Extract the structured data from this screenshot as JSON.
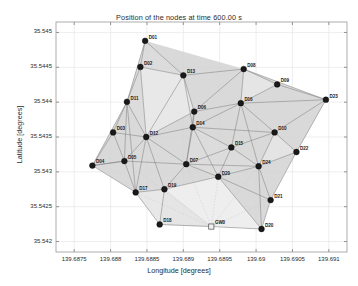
{
  "chart_data": {
    "type": "scatter",
    "title": "Position of the nodes at time 600.00 s",
    "xlabel": "Longitude [degrees]",
    "ylabel": "Latitude [degrees]",
    "xlim": [
      139.68725,
      139.69125
    ],
    "ylim": [
      35.54185,
      35.54515
    ],
    "xticks": [
      "139.6875",
      "139.688",
      "139.6885",
      "139.689",
      "139.6895",
      "139.69",
      "139.6905",
      "139.691"
    ],
    "xtick_values": [
      139.6875,
      139.688,
      139.6885,
      139.689,
      139.6895,
      139.69,
      139.6905,
      139.691
    ],
    "yticks": [
      "35.545",
      "35.5445",
      "35.544",
      "35.5435",
      "35.543",
      "35.5425",
      "35.542"
    ],
    "ytick_values": [
      35.545,
      35.5445,
      35.544,
      35.5435,
      35.543,
      35.5425,
      35.542
    ],
    "grid": true,
    "legend": "none",
    "node_color": "#1a1a1a",
    "edge_color": "#7a7a7a",
    "coverage_color": "#d2d2d2",
    "gateway_marker": "square",
    "node_marker": "circle",
    "nodes": [
      {
        "id": "D01",
        "lon": 139.688475,
        "lat": 35.54488,
        "type": "node"
      },
      {
        "id": "D02",
        "lon": 139.68841,
        "lat": 35.544505,
        "type": "node"
      },
      {
        "id": "D13",
        "lon": 139.689,
        "lat": 35.544385,
        "type": "node"
      },
      {
        "id": "D08",
        "lon": 139.68983,
        "lat": 35.544475,
        "type": "node"
      },
      {
        "id": "D09",
        "lon": 139.69029,
        "lat": 35.544255,
        "type": "node"
      },
      {
        "id": "D23",
        "lon": 139.69096,
        "lat": 35.544035,
        "type": "node"
      },
      {
        "id": "D11",
        "lon": 139.688225,
        "lat": 35.544005,
        "type": "node"
      },
      {
        "id": "D16",
        "lon": 139.68979,
        "lat": 35.543985,
        "type": "node"
      },
      {
        "id": "D06",
        "lon": 139.68915,
        "lat": 35.543865,
        "type": "node"
      },
      {
        "id": "D14",
        "lon": 139.68913,
        "lat": 35.54364,
        "type": "node"
      },
      {
        "id": "D03",
        "lon": 139.688035,
        "lat": 35.543565,
        "type": "node"
      },
      {
        "id": "D12",
        "lon": 139.68849,
        "lat": 35.5435,
        "type": "node"
      },
      {
        "id": "D10",
        "lon": 139.690255,
        "lat": 35.543565,
        "type": "node"
      },
      {
        "id": "D15",
        "lon": 139.68966,
        "lat": 35.54335,
        "type": "node"
      },
      {
        "id": "D22",
        "lon": 139.690555,
        "lat": 35.543285,
        "type": "node"
      },
      {
        "id": "D05",
        "lon": 139.68819,
        "lat": 35.543155,
        "type": "node"
      },
      {
        "id": "D04",
        "lon": 139.68775,
        "lat": 35.54309,
        "type": "node"
      },
      {
        "id": "D07",
        "lon": 139.68904,
        "lat": 35.54311,
        "type": "node"
      },
      {
        "id": "D24",
        "lon": 139.690035,
        "lat": 35.54308,
        "type": "node"
      },
      {
        "id": "D20",
        "lon": 139.68948,
        "lat": 35.54293,
        "type": "node"
      },
      {
        "id": "D17",
        "lon": 139.688345,
        "lat": 35.542705,
        "type": "node"
      },
      {
        "id": "D19",
        "lon": 139.68874,
        "lat": 35.54275,
        "type": "node"
      },
      {
        "id": "D21",
        "lon": 139.6902,
        "lat": 35.542595,
        "type": "node"
      },
      {
        "id": "D18",
        "lon": 139.688675,
        "lat": 35.542245,
        "type": "node"
      },
      {
        "id": "GW0",
        "lon": 139.689385,
        "lat": 35.542215,
        "type": "gateway"
      },
      {
        "id": "D20b",
        "lon": 139.690075,
        "lat": 35.54218,
        "type": "node",
        "label": "D20"
      }
    ],
    "edges": [
      [
        "D01",
        "D02"
      ],
      [
        "D01",
        "D13"
      ],
      [
        "D02",
        "D13"
      ],
      [
        "D02",
        "D11"
      ],
      [
        "D13",
        "D08"
      ],
      [
        "D13",
        "D06"
      ],
      [
        "D13",
        "D14"
      ],
      [
        "D13",
        "D12"
      ],
      [
        "D08",
        "D09"
      ],
      [
        "D08",
        "D16"
      ],
      [
        "D08",
        "D23"
      ],
      [
        "D09",
        "D23"
      ],
      [
        "D09",
        "D16"
      ],
      [
        "D23",
        "D16"
      ],
      [
        "D23",
        "D10"
      ],
      [
        "D23",
        "D22"
      ],
      [
        "D11",
        "D03"
      ],
      [
        "D11",
        "D12"
      ],
      [
        "D11",
        "D05"
      ],
      [
        "D11",
        "D17"
      ],
      [
        "D16",
        "D06"
      ],
      [
        "D16",
        "D14"
      ],
      [
        "D16",
        "D10"
      ],
      [
        "D16",
        "D15"
      ],
      [
        "D16",
        "D24"
      ],
      [
        "D06",
        "D14"
      ],
      [
        "D06",
        "D12"
      ],
      [
        "D06",
        "D07"
      ],
      [
        "D14",
        "D12"
      ],
      [
        "D14",
        "D07"
      ],
      [
        "D14",
        "D15"
      ],
      [
        "D14",
        "D20"
      ],
      [
        "D03",
        "D12"
      ],
      [
        "D03",
        "D05"
      ],
      [
        "D03",
        "D04"
      ],
      [
        "D12",
        "D05"
      ],
      [
        "D12",
        "D07"
      ],
      [
        "D12",
        "D17"
      ],
      [
        "D10",
        "D22"
      ],
      [
        "D10",
        "D15"
      ],
      [
        "D10",
        "D24"
      ],
      [
        "D15",
        "D24"
      ],
      [
        "D15",
        "D07"
      ],
      [
        "D22",
        "D24"
      ],
      [
        "D22",
        "D21"
      ],
      [
        "D05",
        "D04"
      ],
      [
        "D05",
        "D17"
      ],
      [
        "D05",
        "D07"
      ],
      [
        "D04",
        "D17"
      ],
      [
        "D07",
        "D20"
      ],
      [
        "D07",
        "D19"
      ],
      [
        "D07",
        "D24"
      ],
      [
        "D24",
        "D20"
      ],
      [
        "D24",
        "D21"
      ],
      [
        "D24",
        "D20b"
      ],
      [
        "D20",
        "D19"
      ],
      [
        "D20",
        "D21"
      ],
      [
        "D20",
        "D20b"
      ],
      [
        "D17",
        "D19"
      ],
      [
        "D17",
        "D18"
      ],
      [
        "D19",
        "D18"
      ],
      [
        "D21",
        "D20b"
      ],
      [
        "D18",
        "GW0"
      ],
      [
        "GW0",
        "D20b"
      ],
      [
        "D01",
        "D11"
      ],
      [
        "D02",
        "D12"
      ],
      [
        "D04",
        "D05"
      ],
      [
        "D15",
        "D20"
      ],
      [
        "D12",
        "D19"
      ],
      [
        "D06",
        "D08"
      ],
      [
        "D14",
        "D10"
      ],
      [
        "D11",
        "D04"
      ]
    ],
    "faint_edges": [
      [
        "GW0",
        "D19"
      ],
      [
        "GW0",
        "D17"
      ],
      [
        "GW0",
        "D07"
      ],
      [
        "GW0",
        "D20"
      ],
      [
        "GW0",
        "D24"
      ],
      [
        "GW0",
        "D21"
      ],
      [
        "GW0",
        "D18"
      ],
      [
        "GW0",
        "D05"
      ]
    ]
  },
  "nodes_display": {
    "D01": "D01",
    "D02": "D02",
    "D13": "D13",
    "D08": "D08",
    "D09": "D09",
    "D23": "D23",
    "D11": "D11",
    "D16": "D16",
    "D06": "D06",
    "D14": "D14",
    "D03": "D03",
    "D12": "D12",
    "D10": "D10",
    "D15": "D15",
    "D22": "D22",
    "D05": "D05",
    "D04": "D04",
    "D07": "D07",
    "D24": "D24",
    "D20": "D20",
    "D17": "D17",
    "D19": "D19",
    "D21": "D21",
    "D18": "D18",
    "GW0": "GW0",
    "D20b": "D20"
  }
}
